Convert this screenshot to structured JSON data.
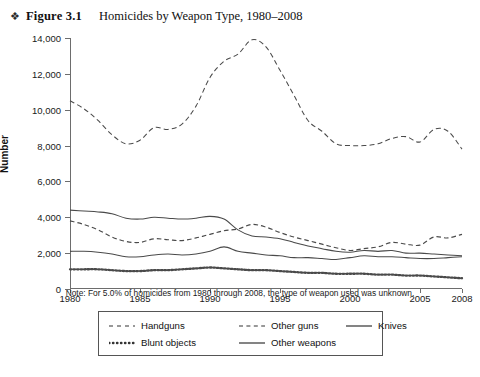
{
  "header": {
    "bullet_icon": "❖",
    "figure_label": "Figure 3.1",
    "title": "Homicides by Weapon Type, 1980–2008"
  },
  "note": "Note: For 5.0% of homicides from 1980 through 2008, the type of weapon used was unknown.",
  "axis": {
    "y_title": "Number",
    "y_ticks": [
      "0",
      "2,000",
      "4,000",
      "6,000",
      "8,000",
      "10,000",
      "12,000",
      "14,000"
    ],
    "x_ticks": [
      "1980",
      "1985",
      "1990",
      "1995",
      "2000",
      "2005",
      "2008"
    ]
  },
  "legend": {
    "rows": [
      [
        {
          "label": "Handguns",
          "style": "dashed-long"
        },
        {
          "label": "Other guns",
          "style": "dashed-short"
        },
        {
          "label": "Knives",
          "style": "solid"
        }
      ],
      [
        {
          "label": "Blunt objects",
          "style": "dotted"
        },
        {
          "label": "Other weapons",
          "style": "solid"
        }
      ]
    ]
  },
  "chart_data": {
    "type": "line",
    "title": "Homicides by Weapon Type, 1980–2008",
    "xlabel": "",
    "ylabel": "Number",
    "ylim": [
      0,
      14000
    ],
    "xlim": [
      1980,
      2008
    ],
    "grid": false,
    "legend_position": "bottom",
    "x": [
      1980,
      1981,
      1982,
      1983,
      1984,
      1985,
      1986,
      1987,
      1988,
      1989,
      1990,
      1991,
      1992,
      1993,
      1994,
      1995,
      1996,
      1997,
      1998,
      1999,
      2000,
      2001,
      2002,
      2003,
      2004,
      2005,
      2006,
      2007,
      2008
    ],
    "series": [
      {
        "name": "Handguns",
        "style": "dashed-long",
        "values": [
          10500,
          10050,
          9400,
          8600,
          8100,
          8300,
          9000,
          8900,
          9200,
          10200,
          11800,
          12700,
          13100,
          13900,
          13500,
          12200,
          10800,
          9400,
          8800,
          8100,
          8000,
          8000,
          8100,
          8400,
          8500,
          8200,
          8900,
          8800,
          7800
        ]
      },
      {
        "name": "Other guns",
        "style": "dashed-short",
        "values": [
          3800,
          3600,
          3300,
          2900,
          2650,
          2600,
          2800,
          2750,
          2700,
          2850,
          3050,
          3250,
          3350,
          3600,
          3450,
          3150,
          2900,
          2700,
          2500,
          2300,
          2150,
          2250,
          2350,
          2600,
          2500,
          2450,
          2900,
          2850,
          3050
        ]
      },
      {
        "name": "Knives",
        "style": "solid",
        "values": [
          4400,
          4350,
          4300,
          4200,
          3950,
          3900,
          4000,
          3950,
          3900,
          3950,
          4050,
          3900,
          3300,
          2950,
          2900,
          2800,
          2600,
          2400,
          2250,
          2100,
          2050,
          2150,
          2100,
          2150,
          2000,
          2000,
          1950,
          1900,
          1850
        ]
      },
      {
        "name": "Other weapons",
        "style": "solid",
        "values": [
          2100,
          2100,
          2050,
          1950,
          1800,
          1800,
          1900,
          1950,
          1900,
          1950,
          2100,
          2350,
          2100,
          2000,
          1900,
          1850,
          1750,
          1750,
          1700,
          1650,
          1750,
          1850,
          1800,
          1800,
          1750,
          1700,
          1700,
          1750,
          1800
        ]
      },
      {
        "name": "Blunt objects",
        "style": "dotted",
        "values": [
          1100,
          1100,
          1100,
          1050,
          1000,
          1000,
          1050,
          1050,
          1100,
          1150,
          1200,
          1150,
          1100,
          1050,
          1050,
          1000,
          950,
          900,
          900,
          850,
          850,
          850,
          800,
          800,
          750,
          750,
          700,
          650,
          600
        ]
      }
    ]
  }
}
